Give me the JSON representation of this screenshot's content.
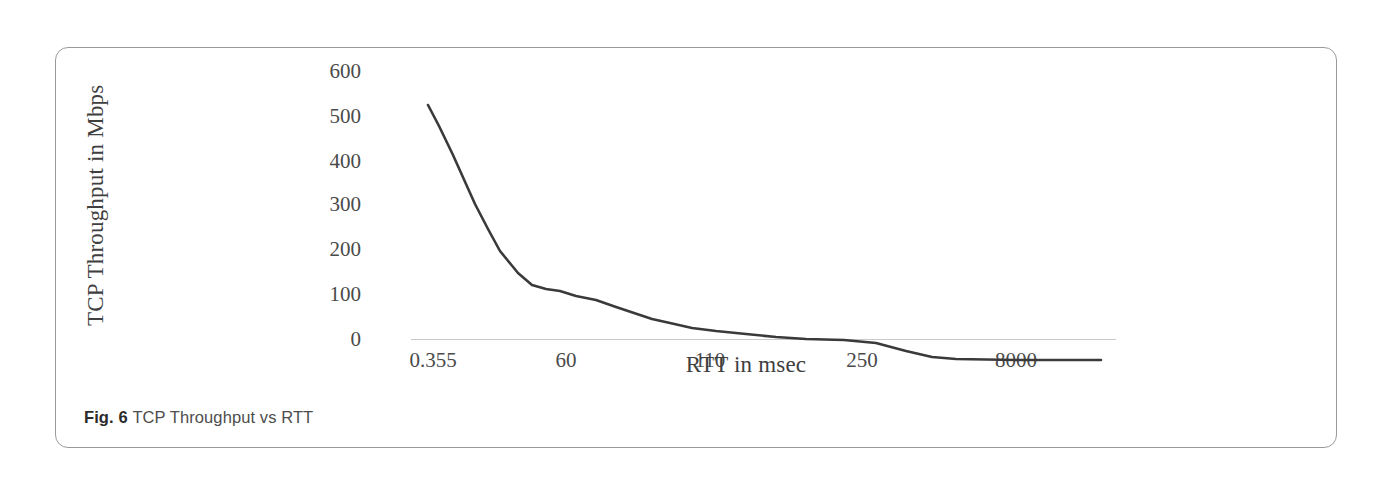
{
  "figure": {
    "caption_label": "Fig. 6",
    "caption_text": "TCP Throughput vs RTT"
  },
  "style": {
    "line_color": "#3a3a3a",
    "axis_color": "#c9c9c9",
    "border_color": "#9a9a9a",
    "text_color": "#4a4a4a",
    "background": "#ffffff"
  },
  "chart_data": {
    "type": "line",
    "title": "",
    "xlabel": "RTT in msec",
    "ylabel": "TCP Throughput in Mbps",
    "categories": [
      "0.355",
      "60",
      "110",
      "250",
      "8000"
    ],
    "x_tick_labels": [
      "0.355",
      "60",
      "110",
      "250",
      "8000"
    ],
    "y_tick_labels": [
      "0",
      "100",
      "200",
      "300",
      "400",
      "500",
      "600"
    ],
    "ylim": [
      0,
      600
    ],
    "ytick_step": 100,
    "grid": false,
    "legend": "none",
    "series": [
      {
        "name": "TCP Throughput",
        "x": [
          "0.355",
          "8",
          "20",
          "40",
          "60",
          "75",
          "90",
          "110",
          "130",
          "150",
          "180",
          "210",
          "250",
          "300",
          "450",
          "900",
          "2000",
          "4000",
          "8000"
        ],
        "values": [
          520,
          420,
          318,
          268,
          165,
          143,
          140,
          128,
          112,
          95,
          78,
          64,
          57,
          50,
          42,
          33,
          4,
          2,
          2
        ]
      }
    ],
    "annotations": []
  },
  "plot_geometry": {
    "note": "normalized polyline points used to draw the series in the plot box",
    "points": [
      [
        372,
        57
      ],
      [
        383,
        78
      ],
      [
        397,
        107
      ],
      [
        410,
        136
      ],
      [
        419,
        156
      ],
      [
        432,
        181
      ],
      [
        444,
        203
      ],
      [
        462,
        225
      ],
      [
        476,
        237
      ],
      [
        490,
        241
      ],
      [
        504,
        243
      ],
      [
        520,
        248
      ],
      [
        540,
        252
      ],
      [
        560,
        259
      ],
      [
        578,
        265
      ],
      [
        596,
        271
      ],
      [
        614,
        275
      ],
      [
        636,
        280
      ],
      [
        660,
        283
      ],
      [
        690,
        286
      ],
      [
        720,
        289
      ],
      [
        750,
        291
      ],
      [
        788,
        292
      ],
      [
        820,
        295
      ],
      [
        850,
        303
      ],
      [
        876,
        309
      ],
      [
        900,
        311
      ],
      [
        960,
        312
      ],
      [
        1000,
        312
      ],
      [
        1045,
        312
      ]
    ]
  }
}
